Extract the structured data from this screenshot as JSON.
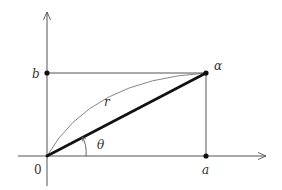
{
  "diagram": {
    "labels": {
      "origin": "0",
      "real_part": "a",
      "imag_part": "b",
      "point": "α",
      "modulus": "r",
      "angle": "θ"
    },
    "colors": {
      "axis": "#555555",
      "radius": "#111111",
      "guide": "#555555",
      "arc": "#777777",
      "point": "#111111"
    }
  }
}
